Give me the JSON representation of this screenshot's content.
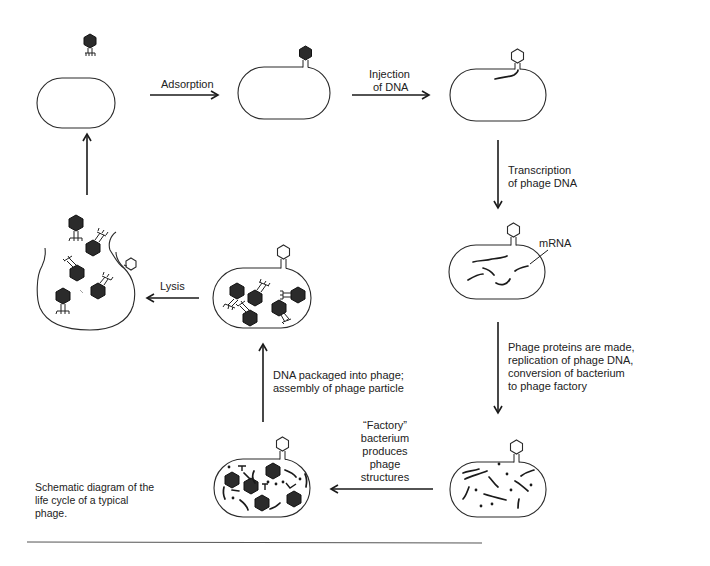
{
  "figure": {
    "caption": [
      "Schematic diagram of the",
      "life cycle of a typical",
      "phage."
    ]
  },
  "steps": {
    "adsorption": "Adsorption",
    "injection": [
      "Injection",
      "of DNA"
    ],
    "transcription": [
      "Transcription",
      "of phage DNA"
    ],
    "mrna_label": "mRNA",
    "protein_synthesis": [
      "Phage proteins are made,",
      "replication of phage DNA,",
      "conversion of bacterium",
      "to phage factory"
    ],
    "factory": [
      "“Factory”",
      "bacterium",
      "produces",
      "phage",
      "structures"
    ],
    "packaging": [
      "DNA packaged into phage;",
      "assembly of phage particle"
    ],
    "lysis": "Lysis"
  },
  "stages": [
    {
      "id": "free-phage-and-bacterium",
      "icon": "phage-approaching-bacterium"
    },
    {
      "id": "phage-adsorbed",
      "icon": "phage-attached-bacterium"
    },
    {
      "id": "dna-injected",
      "icon": "empty-phage-coat-with-dna"
    },
    {
      "id": "mrna-transcribed",
      "icon": "bacterium-with-mrna"
    },
    {
      "id": "phage-factory",
      "icon": "bacterium-with-dna-and-proteins"
    },
    {
      "id": "phage-structures",
      "icon": "bacterium-with-heads-and-tails"
    },
    {
      "id": "assembled-phages",
      "icon": "bacterium-with-mature-phages"
    },
    {
      "id": "lysed-cell",
      "icon": "burst-bacterium-releasing-phages"
    }
  ],
  "colors": {
    "ink": "#1a1a1a",
    "background": "#ffffff"
  }
}
